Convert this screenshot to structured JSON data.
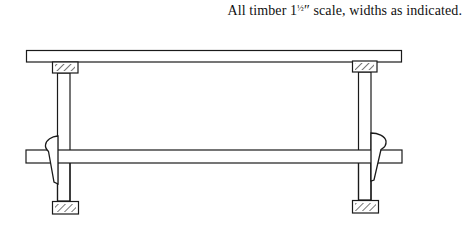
{
  "caption": {
    "prefix": "All timber 1",
    "fraction": "½",
    "inch_mark": "″",
    "suffix": " scale, widths as indicated."
  },
  "diagram": {
    "stroke_color": "#1a1a1a",
    "parts": [
      "top-board",
      "left-top-block",
      "right-top-block",
      "left-post",
      "right-post",
      "cross-bar",
      "left-wedge",
      "right-wedge",
      "left-bottom-block",
      "right-bottom-block"
    ]
  }
}
